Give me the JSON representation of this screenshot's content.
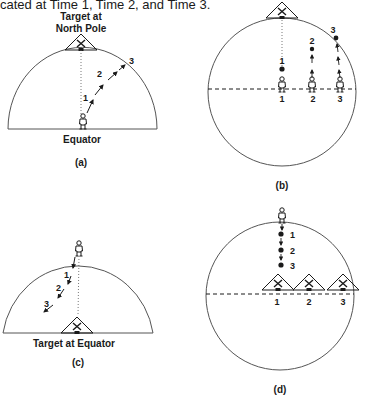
{
  "header_text": "cated at Time 1, Time 2, and Time 3.",
  "panels": {
    "a": {
      "caption": "(a)",
      "target_label_line1": "Target at",
      "target_label_line2": "North Pole",
      "observer_label": "Equator",
      "time_labels": [
        "1",
        "2",
        "3"
      ]
    },
    "b": {
      "caption": "(b)",
      "dot_labels": [
        "1",
        "2",
        "3"
      ],
      "position_labels": [
        "1",
        "2",
        "3"
      ]
    },
    "c": {
      "caption": "(c)",
      "target_label": "Target at Equator",
      "time_labels": [
        "1",
        "2",
        "3"
      ]
    },
    "d": {
      "caption": "(d)",
      "dot_labels": [
        "1",
        "2",
        "3"
      ],
      "position_labels": [
        "1",
        "2",
        "3"
      ]
    }
  },
  "colors": {
    "ink": "#1a1a1a",
    "line": "#555555",
    "background": "#ffffff"
  }
}
